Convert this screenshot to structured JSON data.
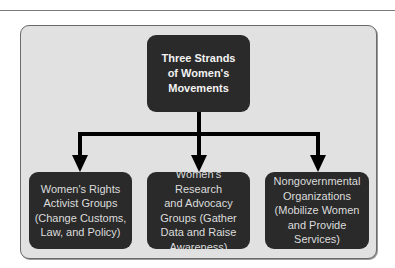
{
  "diagram": {
    "root": {
      "label": "Three Strands\nof Women's\nMovements"
    },
    "children": [
      {
        "label": "Women's Rights\nActivist Groups\n(Change Customs,\nLaw, and Policy)"
      },
      {
        "label": "Women's Research\nand Advocacy\nGroups (Gather\nData and Raise\nAwareness)"
      },
      {
        "label": "Nongovernmental\nOrganizations\n(Mobilize Women\nand Provide\nServices)"
      }
    ],
    "colors": {
      "node_fill": "#2a2a2a",
      "panel_fill": "#e1e1e1",
      "connector": "#000000",
      "node_text": "#dcdcdc"
    }
  }
}
